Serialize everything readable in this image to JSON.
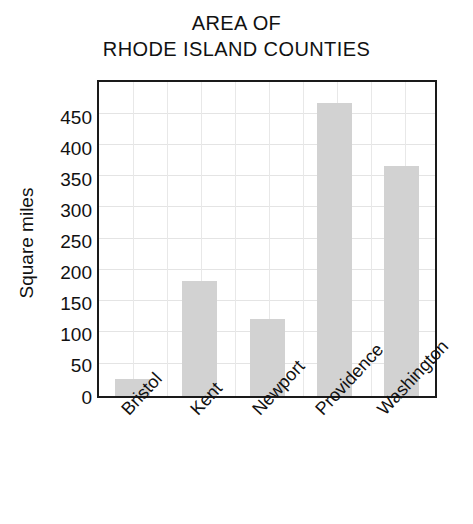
{
  "chart_data": {
    "type": "bar",
    "title": "AREA OF RHODE ISLAND COUNTIES",
    "title_line1": "AREA OF",
    "title_line2": "RHODE ISLAND COUNTIES",
    "categories": [
      "Bristol",
      "Kent",
      "Newport",
      "Providence",
      "Washington"
    ],
    "values": [
      25,
      165,
      110,
      420,
      330
    ],
    "series": [
      {
        "name": "Square miles",
        "values": [
          25,
          165,
          110,
          420,
          330
        ]
      }
    ],
    "xlabel": "",
    "ylabel": "Square miles",
    "ylim": [
      0,
      450
    ],
    "ytick_step": 50,
    "yticks": [
      450,
      400,
      350,
      300,
      250,
      200,
      150,
      100,
      50,
      0
    ],
    "ytick_labels": [
      "450",
      "400",
      "350",
      "300",
      "250",
      "200",
      "150",
      "100",
      "50",
      "0"
    ],
    "grid": true,
    "grid_horizontal_count": 9,
    "grid_vertical_count": 9,
    "legend": false,
    "legend_position": "none",
    "xtick_rotation": -47,
    "colors": {
      "bar_fill": "#d2d2d2",
      "frame": "#1a1a1a",
      "gridline": "#e4e4e4",
      "text": "#111111",
      "background": "#ffffff"
    }
  }
}
